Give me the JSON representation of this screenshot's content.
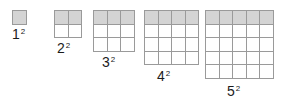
{
  "figure": {
    "background_color": "#ffffff",
    "grid_line_color": "#9a9a9a",
    "shaded_cell_color": "#d4d4d4",
    "unshaded_cell_color": "#ffffff",
    "label_color": "#1b1b1b",
    "cell_size_px": 13.5,
    "top_edge_y_px": 10
  },
  "items": [
    {
      "n": 1,
      "base": "1",
      "exponent": "2",
      "columns": 1,
      "rows": 1,
      "total_cells": 1,
      "shaded_cells": 1,
      "left_px": 12,
      "width_px": 14,
      "height_px": 14,
      "label_left_px": 12,
      "label_top_px": 27
    },
    {
      "n": 2,
      "base": "2",
      "exponent": "2",
      "columns": 2,
      "rows": 2,
      "total_cells": 4,
      "shaded_cells": 2,
      "left_px": 54,
      "width_px": 28,
      "height_px": 28,
      "label_left_px": 57,
      "label_top_px": 41
    },
    {
      "n": 3,
      "base": "3",
      "exponent": "2",
      "columns": 3,
      "rows": 3,
      "total_cells": 9,
      "shaded_cells": 3,
      "left_px": 93,
      "width_px": 42,
      "height_px": 42,
      "label_left_px": 102,
      "label_top_px": 55
    },
    {
      "n": 4,
      "base": "4",
      "exponent": "2",
      "columns": 4,
      "rows": 4,
      "total_cells": 16,
      "shaded_cells": 4,
      "left_px": 144,
      "width_px": 55,
      "height_px": 55,
      "label_left_px": 157,
      "label_top_px": 69
    },
    {
      "n": 5,
      "base": "5",
      "exponent": "2",
      "columns": 5,
      "rows": 5,
      "total_cells": 25,
      "shaded_cells": 5,
      "left_px": 205,
      "width_px": 69,
      "height_px": 69,
      "label_left_px": 227,
      "label_top_px": 84
    }
  ]
}
